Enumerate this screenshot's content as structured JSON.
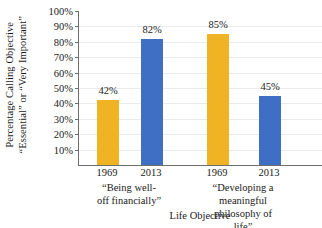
{
  "chart_data": {
    "type": "bar",
    "title": "",
    "xlabel": "Life Objective",
    "ylabel_line1": "Percentage Calling Objective",
    "ylabel_line2": "“Essential” or “Very Important”",
    "ylim": [
      0,
      100
    ],
    "yticks": [
      10,
      20,
      30,
      40,
      50,
      60,
      70,
      80,
      90,
      100
    ],
    "ytick_labels": [
      "10%",
      "20%",
      "30%",
      "40%",
      "50%",
      "60%",
      "70%",
      "80%",
      "90%",
      "100%"
    ],
    "grid": true,
    "legend": "none",
    "categories": [
      "1969",
      "2013",
      "1969",
      "2013"
    ],
    "values": [
      42,
      82,
      85,
      45
    ],
    "value_labels": [
      "42%",
      "82%",
      "85%",
      "45%"
    ],
    "bar_colors": [
      "#f0b323",
      "#3f6fc4",
      "#f0b323",
      "#3f6fc4"
    ],
    "groups": [
      {
        "label_line1": "“Being well-",
        "label_line2": "off financially”",
        "bars": [
          {
            "category": "1969",
            "value": 42,
            "label": "42%",
            "color": "#f0b323"
          },
          {
            "category": "2013",
            "value": 82,
            "label": "82%",
            "color": "#3f6fc4"
          }
        ]
      },
      {
        "label_line1": "“Developing a meaningful",
        "label_line2": "philosophy of life”",
        "bars": [
          {
            "category": "1969",
            "value": 85,
            "label": "85%",
            "color": "#f0b323"
          },
          {
            "category": "2013",
            "value": 45,
            "label": "45%",
            "color": "#3f6fc4"
          }
        ]
      }
    ],
    "colors": {
      "series_1969": "#f0b323",
      "series_2013": "#3f6fc4",
      "gridline": "#e8ecef",
      "axis": "#6e6e6e",
      "text": "#1a1a1a",
      "background": "#ffffff"
    }
  }
}
